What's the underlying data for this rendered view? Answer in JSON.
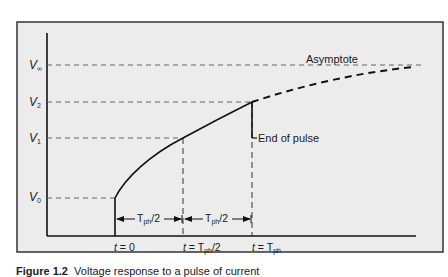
{
  "figure": {
    "y_labels": {
      "v_inf": "V∞",
      "v2": "V2",
      "v1": "V1",
      "v0": "V0"
    },
    "y_label_parts": {
      "v_inf": {
        "main": "V",
        "sub": "∞"
      },
      "v2": {
        "main": "V",
        "sub": "2"
      },
      "v1": {
        "main": "V",
        "sub": "1"
      },
      "v0": {
        "main": "V",
        "sub": "0"
      }
    },
    "annotations": {
      "asymptote": "Asymptote",
      "end_of_pulse": "End of pulse"
    },
    "intervals": [
      {
        "main": "T",
        "sub": "ph",
        "rest": "/2"
      },
      {
        "main": "T",
        "sub": "ph",
        "rest": "/2"
      }
    ],
    "x_labels": [
      {
        "pre": "t",
        "eq": " = 0",
        "sub": "",
        "post": ""
      },
      {
        "pre": "t",
        "eq": " = T",
        "sub": "ph",
        "post": "/2"
      },
      {
        "pre": "t",
        "eq": " = T",
        "sub": "ph",
        "post": ""
      }
    ],
    "colors": {
      "panel_bg": "#ececec",
      "frame": "#333333",
      "line": "#111111",
      "guide": "#444444"
    }
  },
  "caption": {
    "figure_number": "Figure 1.2",
    "text": "Voltage response to a pulse of current"
  }
}
